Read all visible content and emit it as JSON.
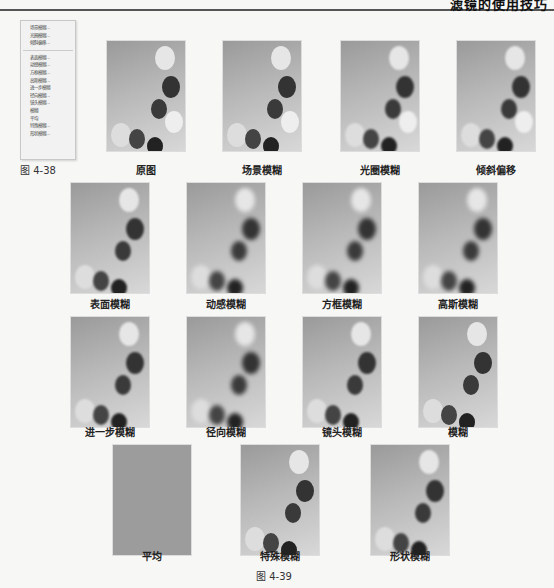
{
  "header": {
    "title": "滤镜的使用技巧"
  },
  "menu": {
    "group1": [
      "场景模糊...",
      "光圈模糊...",
      "倾斜偏移..."
    ],
    "group2": [
      "表面模糊...",
      "动感模糊...",
      "方框模糊...",
      "高斯模糊...",
      "进一步模糊",
      "径向模糊...",
      "镜头模糊...",
      "模糊",
      "平均",
      "特殊模糊...",
      "形状模糊..."
    ]
  },
  "figures": {
    "fig38": "图 4-38",
    "fig39": "图 4-39"
  },
  "rows": [
    [
      "原图",
      "场景模糊",
      "光圈模糊",
      "倾斜偏移"
    ],
    [
      "表面模糊",
      "动感模糊",
      "方框模糊",
      "高斯模糊"
    ],
    [
      "进一步模糊",
      "径向模糊",
      "镜头模糊",
      "模糊"
    ],
    [
      "平均",
      "特殊模糊",
      "形状模糊"
    ]
  ]
}
